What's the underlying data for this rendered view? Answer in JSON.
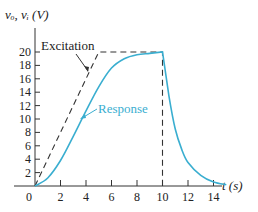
{
  "chart_data": {
    "type": "line",
    "title": "",
    "xlabel": "t (s)",
    "ylabel": "v_o, v_i (V)",
    "xlim": [
      0,
      15
    ],
    "ylim": [
      0,
      20
    ],
    "x_ticks": [
      0,
      2,
      4,
      6,
      8,
      10,
      12,
      14
    ],
    "y_ticks": [
      2,
      4,
      6,
      8,
      10,
      12,
      14,
      16,
      18,
      20
    ],
    "grid": false,
    "legend": "none (inline annotations)",
    "series": [
      {
        "name": "Excitation",
        "style": "dashed",
        "color": "#333333",
        "x": [
          0,
          5,
          10,
          10
        ],
        "y": [
          0,
          20,
          20,
          0
        ]
      },
      {
        "name": "Response",
        "style": "solid",
        "color": "#3aaed0",
        "x": [
          0,
          1,
          2,
          3,
          4,
          5,
          6,
          7,
          8,
          9,
          10,
          10.5,
          11,
          11.5,
          12,
          13,
          14,
          15
        ],
        "y": [
          0,
          1.2,
          3.8,
          7.4,
          11.2,
          14.8,
          17.6,
          19.0,
          19.6,
          19.8,
          20,
          13.5,
          8.5,
          5.5,
          3.5,
          1.6,
          0.6,
          0.2
        ]
      }
    ],
    "annotations": [
      "Excitation",
      "Response"
    ]
  },
  "axes": {
    "ylabel": "vₒ, vᵢ (V)",
    "xlabel": "t (s)",
    "x_tick_labels": [
      "0",
      "2",
      "4",
      "6",
      "8",
      "10",
      "12",
      "14"
    ],
    "y_tick_labels": [
      "2",
      "4",
      "6",
      "8",
      "10",
      "12",
      "14",
      "16",
      "18",
      "20"
    ]
  },
  "labels": {
    "excitation": "Excitation",
    "response": "Response"
  },
  "colors": {
    "response": "#3aaed0",
    "excitation": "#333333",
    "axis": "#333333"
  }
}
